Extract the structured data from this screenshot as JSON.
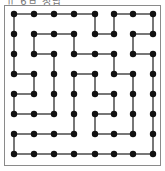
{
  "caption": "ㅠ 6ㅂ 정답",
  "puzzle": {
    "type": "maze-dot-grid",
    "rows": 8,
    "cols": 8,
    "dot_color": "#111111",
    "line_color": "#555555",
    "horizontal_edges": {
      "0": [
        0,
        1,
        2,
        3,
        5,
        6
      ],
      "1": [
        1,
        2,
        4,
        6
      ],
      "2": [
        1,
        3,
        4,
        6
      ],
      "3": [
        0,
        3,
        5
      ],
      "4": [
        0,
        4
      ],
      "5": [
        0,
        1,
        4
      ],
      "6": [
        0,
        1,
        2,
        4,
        5
      ],
      "7": [
        0,
        1,
        2,
        3,
        4,
        5,
        6
      ]
    },
    "vertical_edges": {
      "0": [
        0,
        4,
        5,
        7
      ],
      "1": [
        0,
        1,
        3,
        6
      ],
      "2": [
        0,
        2,
        5,
        7
      ],
      "3": [
        1,
        2,
        3,
        4,
        6,
        7
      ],
      "4": [
        0,
        2,
        3,
        5,
        6,
        7
      ],
      "5": [
        3,
        4,
        6,
        7
      ],
      "6": [
        0,
        7
      ]
    }
  }
}
